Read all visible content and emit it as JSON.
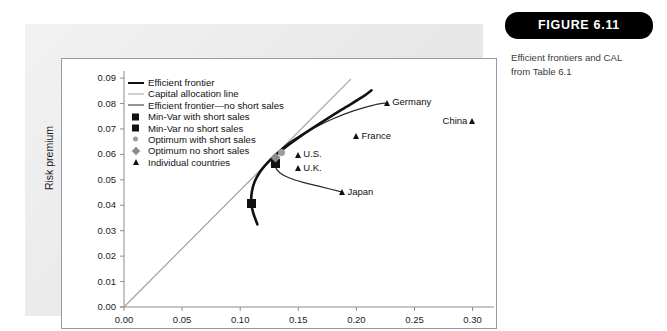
{
  "figure": {
    "badge_label": "FIGURE 6.11",
    "caption_line1": "Efficient frontiers and CAL",
    "caption_line2": "from Table 6.1"
  },
  "chart_data": {
    "type": "scatter",
    "title": "",
    "xlabel": "Standard deviation (%)",
    "ylabel": "Risk premium",
    "xlim": [
      0.0,
      0.315
    ],
    "ylim": [
      0.0,
      0.092
    ],
    "xticks": [
      "0.00",
      "0.05",
      "0.10",
      "0.15",
      "0.20",
      "0.25",
      "0.30"
    ],
    "xtick_values": [
      0.0,
      0.05,
      0.1,
      0.15,
      0.2,
      0.25,
      0.3
    ],
    "yticks": [
      "0.00",
      "0.01",
      "0.02",
      "0.03",
      "0.04",
      "0.05",
      "0.06",
      "0.07",
      "0.08",
      "0.09"
    ],
    "ytick_values": [
      0.0,
      0.01,
      0.02,
      0.03,
      0.04,
      0.05,
      0.06,
      0.07,
      0.08,
      0.09
    ],
    "grid": false,
    "legend_position": "upper-left-inside",
    "legend": [
      {
        "label": "Efficient frontier",
        "key": "thick-black-line"
      },
      {
        "label": "Capital allocation line",
        "key": "gray-line"
      },
      {
        "label": "Efficient frontier—no short sales",
        "key": "thin-black-line"
      },
      {
        "label": "Min-Var with short sales",
        "key": "black-square"
      },
      {
        "label": "Min-Var no short sales",
        "key": "black-square"
      },
      {
        "label": "Optimum with short sales",
        "key": "gray-circle"
      },
      {
        "label": "Optimum no short sales",
        "key": "gray-diamond"
      },
      {
        "label": "Individual countries",
        "key": "black-triangle"
      }
    ],
    "series": [
      {
        "name": "Efficient frontier",
        "type": "line",
        "style": "thick-black",
        "points": [
          [
            0.1148,
            0.0325
          ],
          [
            0.1112,
            0.037
          ],
          [
            0.1096,
            0.0408
          ],
          [
            0.11,
            0.0452
          ],
          [
            0.1125,
            0.0493
          ],
          [
            0.117,
            0.0531
          ],
          [
            0.1232,
            0.0566
          ],
          [
            0.1305,
            0.0598
          ],
          [
            0.14,
            0.0632
          ],
          [
            0.152,
            0.0672
          ],
          [
            0.168,
            0.072
          ],
          [
            0.187,
            0.0775
          ],
          [
            0.205,
            0.0825
          ],
          [
            0.213,
            0.0852
          ]
        ]
      },
      {
        "name": "Capital allocation line",
        "type": "line",
        "style": "gray",
        "points": [
          [
            0.0,
            0.0
          ],
          [
            0.195,
            0.0895
          ]
        ]
      },
      {
        "name": "Efficient frontier—no short sales",
        "type": "line",
        "style": "thin-black",
        "points": [
          [
            0.188,
            0.0452
          ],
          [
            0.17,
            0.0472
          ],
          [
            0.154,
            0.049
          ],
          [
            0.142,
            0.0508
          ],
          [
            0.134,
            0.0528
          ],
          [
            0.13,
            0.0552
          ],
          [
            0.1295,
            0.0578
          ],
          [
            0.132,
            0.0604
          ],
          [
            0.138,
            0.0632
          ],
          [
            0.148,
            0.0664
          ],
          [
            0.162,
            0.07
          ],
          [
            0.18,
            0.074
          ],
          [
            0.198,
            0.0772
          ],
          [
            0.214,
            0.0793
          ],
          [
            0.2265,
            0.0803
          ]
        ]
      }
    ],
    "markers": [
      {
        "name": "Min-Var with short sales",
        "x": 0.1096,
        "y": 0.0408,
        "shape": "black-square",
        "label": ""
      },
      {
        "name": "Min-Var no short sales",
        "x": 0.13,
        "y": 0.0563,
        "shape": "black-square",
        "label": ""
      },
      {
        "name": "Optimum with short sales",
        "x": 0.1352,
        "y": 0.0608,
        "shape": "gray-circle",
        "label": ""
      },
      {
        "name": "Optimum no short sales",
        "x": 0.13,
        "y": 0.0588,
        "shape": "gray-diamond",
        "label": ""
      }
    ],
    "countries": [
      {
        "label": "Germany",
        "x": 0.2265,
        "y": 0.0803,
        "label_side": "right"
      },
      {
        "label": "China",
        "x": 0.3,
        "y": 0.073,
        "label_side": "left"
      },
      {
        "label": "France",
        "x": 0.2,
        "y": 0.0672,
        "label_side": "right"
      },
      {
        "label": "U.S.",
        "x": 0.15,
        "y": 0.0598,
        "label_side": "right"
      },
      {
        "label": "U.K.",
        "x": 0.15,
        "y": 0.0545,
        "label_side": "right"
      },
      {
        "label": "Japan",
        "x": 0.188,
        "y": 0.0452,
        "label_side": "right"
      }
    ]
  }
}
